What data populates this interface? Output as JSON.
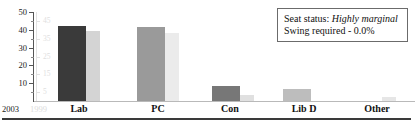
{
  "chart_data": {
    "type": "bar",
    "title": "",
    "xlabel": "",
    "ylabel": "",
    "ylim": [
      0,
      50
    ],
    "grid": false,
    "legend_position": "none",
    "categories": [
      "Lab",
      "PC",
      "Con",
      "Lib D",
      "Other"
    ],
    "y_ticks_major": [
      10,
      20,
      30,
      40,
      50
    ],
    "y_tick_labels": [
      "10",
      "20",
      "30",
      "40",
      "50"
    ],
    "y_ticks_minor": [
      5,
      15,
      25,
      35,
      45
    ],
    "ghost_y_tick_labels": [
      "5",
      "15",
      "25",
      "35",
      "45"
    ],
    "series": [
      {
        "name": "2003",
        "color": "#3a3a3a",
        "values": [
          42.0,
          41.5,
          8.5,
          7.0,
          0.0
        ]
      },
      {
        "name": "1999",
        "color": "#d9d9d9",
        "values": [
          39.5,
          38.0,
          3.5,
          0.0,
          2.0
        ]
      }
    ],
    "series_colors_by_category": {
      "Lab": {
        "current": "#3a3a3a",
        "previous": "#d4d4d4"
      },
      "PC": {
        "current": "#9a9a9a",
        "previous": "#ebebeb"
      },
      "Con": {
        "current": "#777777",
        "previous": "#e0e0e0"
      },
      "Lib D": {
        "current": "#bdbdbd",
        "previous": "#f0f0f0"
      },
      "Other": {
        "current": "#f2f2f2",
        "previous": "#e6e6e6"
      }
    }
  },
  "axis": {
    "year_current": "2003",
    "year_previous": "1999"
  },
  "status": {
    "seat_status_label": "Seat status:",
    "seat_status_value": "Highly marginal",
    "swing_line": "Swing required - 0.0%"
  }
}
